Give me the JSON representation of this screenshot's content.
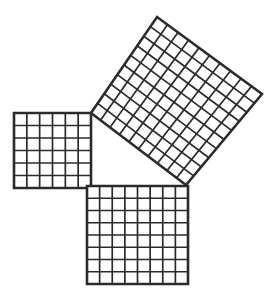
{
  "figure": {
    "background_color": "#ffffff",
    "line_color": "#2b2b2b",
    "cell_fill_color": "#ffffff",
    "grid_line_width": 1.7,
    "border_line_width": 2.6,
    "canvas": {
      "width": 269,
      "height": 294
    }
  },
  "chart_data": {
    "type": "diagram",
    "relation": "36 + 64 = 100",
    "triangle": {
      "label": "right-triangle",
      "legs": [
        6,
        8
      ],
      "hypotenuse": 10,
      "right_angle_vertex": [
        91,
        185
      ],
      "vertices": [
        [
          91,
          113
        ],
        [
          91,
          185
        ],
        [
          186,
          185
        ]
      ]
    },
    "squares": [
      {
        "name": "leg-a-square",
        "side_cells": 6,
        "total_cells": 36,
        "rotation_deg": 0,
        "corners": [
          [
            14,
            113
          ],
          [
            91,
            113
          ],
          [
            91,
            188
          ],
          [
            14,
            188
          ]
        ]
      },
      {
        "name": "leg-b-square",
        "side_cells": 8,
        "total_cells": 64,
        "rotation_deg": 0,
        "corners": [
          [
            87,
            186
          ],
          [
            188,
            186
          ],
          [
            188,
            284
          ],
          [
            87,
            284
          ]
        ]
      },
      {
        "name": "hypotenuse-square",
        "side_cells": 10,
        "total_cells": 100,
        "rotation_deg": -55.5,
        "corners": [
          [
            91,
            113
          ],
          [
            157,
            17
          ],
          [
            262,
            94
          ],
          [
            186,
            185
          ]
        ]
      }
    ]
  }
}
